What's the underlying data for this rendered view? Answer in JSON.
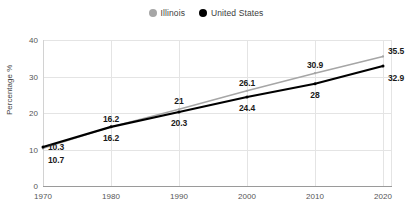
{
  "chart_data": {
    "type": "line",
    "title": "",
    "xlabel": "",
    "ylabel": "Percentage %",
    "x": [
      1970,
      1980,
      1990,
      2000,
      2010,
      2020
    ],
    "xtick_labels": [
      "1970",
      "1980",
      "1990",
      "2000",
      "2010",
      "2020"
    ],
    "ytick_labels": [
      "0",
      "10",
      "20",
      "30",
      "40"
    ],
    "yticks": [
      0,
      10,
      20,
      30,
      40
    ],
    "ylim": [
      0,
      40
    ],
    "xlim": [
      1970,
      2020
    ],
    "grid": true,
    "legend_position": "top-center",
    "series": [
      {
        "name": "Illinois",
        "color": "#a6a6a6",
        "values": [
          10.3,
          16.2,
          21,
          26.1,
          30.9,
          35.5
        ],
        "value_labels": [
          "10.3",
          "16.2",
          "21",
          "26.1",
          "30.9",
          "35.5"
        ],
        "label_side": "above"
      },
      {
        "name": "United States",
        "color": "#000000",
        "values": [
          10.7,
          16.2,
          20.3,
          24.4,
          28,
          32.9
        ],
        "value_labels": [
          "10.7",
          "16.2",
          "20.3",
          "24.4",
          "28",
          "32.9"
        ],
        "label_side": "below"
      }
    ]
  },
  "legend": {
    "items": [
      {
        "label": "Illinois",
        "color": "#a6a6a6"
      },
      {
        "label": "United States",
        "color": "#000000"
      }
    ]
  },
  "axes": {
    "y_axis_title": "Percentage %"
  },
  "colors": {
    "illinois": "#a6a6a6",
    "united_states": "#000000",
    "grid": "#e4e4e4",
    "axis": "#9a9a9a",
    "tick_text": "#555555",
    "label_text": "#1a1a1a",
    "background": "#ffffff"
  }
}
